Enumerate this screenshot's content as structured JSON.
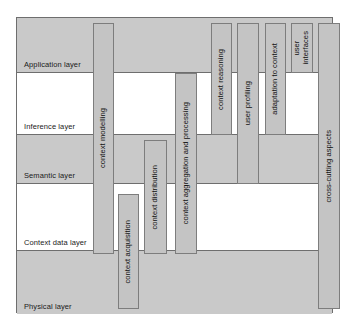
{
  "figure": {
    "frame": {
      "x": 16,
      "y": 17,
      "width": 317,
      "height": 296
    },
    "colors": {
      "band_shaded": "#c9c9c9",
      "band_plain": "#ffffff",
      "bar_fill": "#c4c4c4",
      "bar_border": "#7d7d7d",
      "frame_border": "#6e6e6e",
      "text": "#111111"
    }
  },
  "layers": [
    {
      "label": "Application layer",
      "y": 0,
      "height": 55,
      "shaded": true
    },
    {
      "label": "Inference layer",
      "y": 55,
      "height": 62,
      "shaded": false
    },
    {
      "label": "Semantic layer",
      "y": 117,
      "height": 49,
      "shaded": true
    },
    {
      "label": "Context data layer",
      "y": 166,
      "height": 67,
      "shaded": false
    },
    {
      "label": "Physical layer",
      "y": 233,
      "height": 63,
      "shaded": true
    }
  ],
  "components": [
    {
      "name": "context-modelling",
      "label": "context modelling",
      "x": 76,
      "y": 5,
      "width": 21,
      "height": 231
    },
    {
      "name": "context-acquisition",
      "label": "context acquisition",
      "x": 101,
      "y": 176,
      "width": 21,
      "height": 115
    },
    {
      "name": "context-distribution",
      "label": "context distribution",
      "x": 127,
      "y": 122,
      "width": 23,
      "height": 114
    },
    {
      "name": "context-aggregation-and-processing",
      "label": "context aggregation and processing",
      "x": 158,
      "y": 55,
      "width": 22,
      "height": 181
    },
    {
      "name": "context-reasoning",
      "label": "context reasoning",
      "x": 194,
      "y": 5,
      "width": 21,
      "height": 112
    },
    {
      "name": "user-profiling",
      "label": "user profiling",
      "x": 220,
      "y": 5,
      "width": 22,
      "height": 161
    },
    {
      "name": "adaptation-to-context",
      "label": "adaptation to context",
      "x": 248,
      "y": 5,
      "width": 21,
      "height": 112
    },
    {
      "name": "user-interfaces",
      "label": "user\ninterfaces",
      "x": 274,
      "y": 5,
      "width": 22,
      "height": 50
    },
    {
      "name": "cross-cutting-aspects",
      "label": "cross-cutting aspects",
      "x": 301,
      "y": 5,
      "width": 22,
      "height": 286
    }
  ]
}
